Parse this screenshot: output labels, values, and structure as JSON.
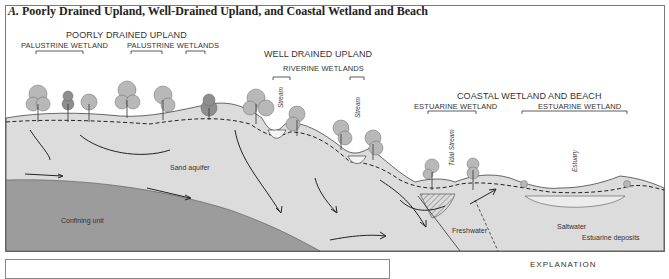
{
  "figure": {
    "panel_title_letter": "A.",
    "panel_title": "Poorly Drained Upland, Well-Drained Upland, and Coastal Wetland and Beach"
  },
  "headings": {
    "poorly_drained": "POORLY DRAINED UPLAND",
    "palustrine_wetland": "PALUSTRINE WETLAND",
    "palustrine_wetlands": "PALUSTRINE WETLANDS",
    "well_drained": "WELL DRAINED UPLAND",
    "riverine_wetlands": "RIVERINE WETLANDS",
    "coastal": "COASTAL WETLAND AND BEACH",
    "estuarine_wetland_1": "ESTUARINE WETLAND",
    "estuarine_wetland_2": "ESTUARINE WETLAND"
  },
  "vertical_labels": {
    "stream_1": "Stream",
    "stream_2": "Stream",
    "tidal_stream": "Tidal Stream",
    "estuary": "Estuary"
  },
  "unit_labels": {
    "sand_aquifer": "Sand aquifer",
    "confining_unit": "Confining unit",
    "freshwater": "Freshwater",
    "saltwater": "Saltwater",
    "estuarine_deposits": "Estuarine deposits"
  },
  "explanation": {
    "label": "EXPLANATION"
  },
  "colors": {
    "aquifer": "#dcdcdc",
    "confining": "#9a9a9a",
    "tree_foliage": "#b8b8b8",
    "water": "#ececec",
    "line": "#333333"
  }
}
